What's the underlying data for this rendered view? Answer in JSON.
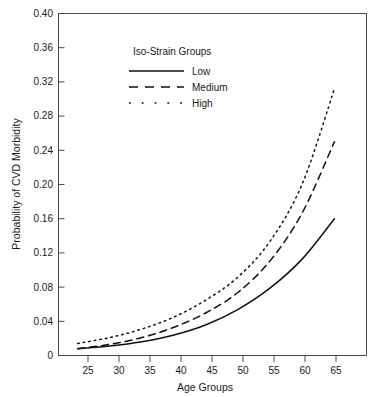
{
  "chart_data": {
    "type": "line",
    "title": "",
    "xlabel": "Age Groups",
    "ylabel": "Probability of CVD Morbidity",
    "xlim": [
      22,
      70
    ],
    "ylim": [
      0,
      0.4
    ],
    "grid": false,
    "legend_position": "top-center-inside",
    "legend_title": "Iso-Strain Groups",
    "x_ticks": [
      25,
      30,
      35,
      40,
      45,
      50,
      55,
      60,
      65
    ],
    "x_tick_labels": [
      "25",
      "30",
      "35",
      "40",
      "45",
      "50",
      "55",
      "60",
      "65"
    ],
    "y_ticks": [
      0,
      0.04,
      0.08,
      0.12,
      0.16,
      0.2,
      0.24,
      0.28,
      0.32,
      0.36,
      0.4
    ],
    "y_tick_labels": [
      "0",
      "0.04",
      "0.08",
      "0.12",
      "0.16",
      "0.20",
      "0.24",
      "0.28",
      "0.32",
      "0.36",
      "0.40"
    ],
    "x": [
      25,
      30,
      35,
      40,
      45,
      50,
      55,
      60,
      65
    ],
    "series": [
      {
        "name": "Low",
        "style": "solid",
        "values": [
          0.008,
          0.011,
          0.016,
          0.024,
          0.036,
          0.054,
          0.079,
          0.113,
          0.16
        ]
      },
      {
        "name": "Medium",
        "style": "dashed",
        "values": [
          0.008,
          0.013,
          0.021,
          0.033,
          0.05,
          0.074,
          0.111,
          0.167,
          0.25
        ]
      },
      {
        "name": "High",
        "style": "dotted",
        "values": [
          0.014,
          0.021,
          0.031,
          0.045,
          0.065,
          0.092,
          0.134,
          0.201,
          0.312
        ]
      }
    ]
  },
  "axes": {
    "y_label": "Probability of CVD Morbidity",
    "x_label": "Age Groups",
    "y_tick_0": "0.40",
    "y_tick_1": "0.36",
    "y_tick_2": "0.32",
    "y_tick_3": "0.28",
    "y_tick_4": "0.24",
    "y_tick_5": "0.20",
    "y_tick_6": "0.16",
    "y_tick_7": "0.12",
    "y_tick_8": "0.08",
    "y_tick_9": "0.04",
    "y_tick_10": "0",
    "x_tick_0": "25",
    "x_tick_1": "30",
    "x_tick_2": "35",
    "x_tick_3": "40",
    "x_tick_4": "45",
    "x_tick_5": "50",
    "x_tick_6": "55",
    "x_tick_7": "60",
    "x_tick_8": "65"
  },
  "legend": {
    "title": "Iso-Strain Groups",
    "entries": [
      {
        "label": "Low",
        "style": "solid"
      },
      {
        "label": "Medium",
        "style": "dashed"
      },
      {
        "label": "High",
        "style": "dotted"
      }
    ]
  },
  "colors": {
    "series_stroke": "#111111",
    "frame": "#4a4a4a",
    "text": "#1a1a1a",
    "background": "#ffffff"
  }
}
